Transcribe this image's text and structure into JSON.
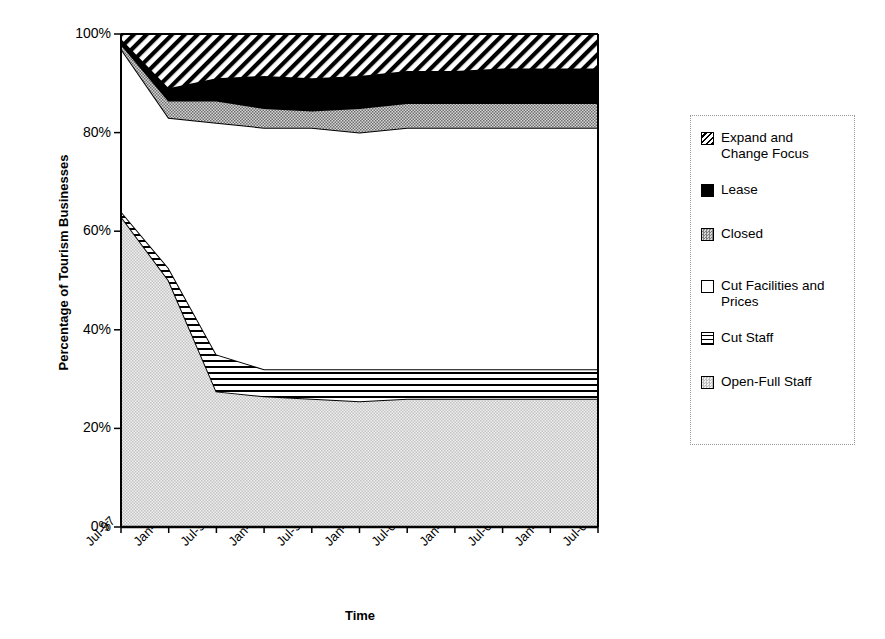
{
  "chart_data": {
    "type": "area",
    "title": "",
    "xlabel": "Time",
    "ylabel": "Percentage of Tourism Businesses",
    "stacked": true,
    "stack_order": "bottom-to-top",
    "ylim": [
      0,
      100
    ],
    "yticks": [
      "0%",
      "20%",
      "40%",
      "60%",
      "80%",
      "100%"
    ],
    "ytick_values": [
      0,
      20,
      40,
      60,
      80,
      100
    ],
    "grid": false,
    "legend_position": "right",
    "categories": [
      "Jul-97",
      "Jan-98",
      "Jul-98",
      "Jan-99",
      "Jul-99",
      "Jan-00",
      "Jul-00",
      "Jan-01",
      "Jul-01",
      "Jan-02",
      "Jul-02"
    ],
    "series": [
      {
        "name": "Open-Full Staff",
        "pattern": "light-gray-stipple",
        "values": [
          63,
          50,
          27.5,
          26.5,
          26,
          25.5,
          26,
          26,
          26,
          26,
          26
        ]
      },
      {
        "name": "Cut Staff",
        "pattern": "horizontal-lines",
        "values": [
          1,
          2.5,
          7.5,
          5.5,
          6,
          6.5,
          6,
          6,
          6,
          6,
          6
        ]
      },
      {
        "name": "Cut Facilities and Prices",
        "pattern": "white",
        "values": [
          33,
          30.5,
          47,
          49,
          49,
          48,
          49,
          49,
          49,
          49,
          49
        ]
      },
      {
        "name": "Closed",
        "pattern": "gray-stipple",
        "values": [
          1,
          3.5,
          4.5,
          4,
          3.5,
          5,
          5,
          5,
          5,
          5,
          5
        ]
      },
      {
        "name": "Lease",
        "pattern": "black",
        "values": [
          1,
          2.5,
          4.5,
          6.5,
          6.5,
          6.5,
          6.5,
          6.5,
          7,
          7,
          7
        ]
      },
      {
        "name": "Expand and Change Focus",
        "pattern": "diagonal-hatch",
        "values": [
          1,
          11,
          9,
          8.5,
          9,
          8.5,
          7.5,
          7.5,
          7,
          7,
          7
        ]
      }
    ],
    "cumulative_tops": {
      "open_full_staff": [
        63,
        50,
        27.5,
        26.5,
        26,
        25.5,
        26,
        26,
        26,
        26,
        26
      ],
      "cut_staff": [
        64,
        52.5,
        35,
        32,
        32,
        32,
        32,
        32,
        32,
        32,
        32
      ],
      "cut_facilities_and_prices": [
        97,
        83,
        82,
        81,
        81,
        80,
        81,
        81,
        81,
        81,
        81
      ],
      "closed": [
        98,
        86.5,
        86.5,
        85,
        84.5,
        85,
        86,
        86,
        86,
        86,
        86
      ],
      "lease": [
        99,
        89,
        91,
        91.5,
        91,
        91.5,
        92.5,
        92.5,
        93,
        93,
        93
      ],
      "expand_and_change_focus": [
        100,
        100,
        100,
        100,
        100,
        100,
        100,
        100,
        100,
        100,
        100
      ]
    }
  },
  "axis": {
    "y_title": "Percentage of Tourism Businesses",
    "x_title": "Time",
    "y_labels": [
      "100%",
      "80%",
      "60%",
      "40%",
      "20%",
      "0%"
    ],
    "x_labels": [
      "Jul-97",
      "Jan-98",
      "Jul-98",
      "Jan-99",
      "Jul-99",
      "Jan-00",
      "Jul-00",
      "Jan-01",
      "Jul-01",
      "Jan-02",
      "Jul-02"
    ]
  },
  "legend": {
    "items": [
      {
        "label": "Expand and\nChange Focus",
        "swatch": "diagonal-hatch-swatch"
      },
      {
        "label": "Lease",
        "swatch": "black-swatch"
      },
      {
        "label": "Closed",
        "swatch": "gray-stipple-swatch"
      },
      {
        "label": "Cut Facilities and\nPrices",
        "swatch": "white-swatch"
      },
      {
        "label": "Cut Staff",
        "swatch": "horizontal-lines-swatch"
      },
      {
        "label": "Open-Full Staff",
        "swatch": "light-gray-stipple-swatch"
      }
    ]
  },
  "colors": {
    "ink": "#000000",
    "background": "#ffffff",
    "closed_gray": "#9e9e9e",
    "open_full_gray": "#d9d9d9",
    "legend_border": "#9a9a9a"
  }
}
